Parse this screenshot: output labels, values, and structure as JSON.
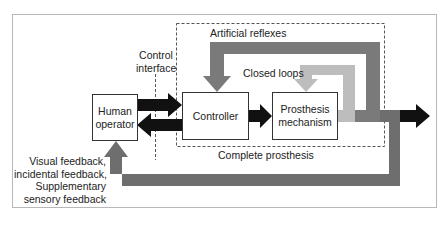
{
  "diagram": {
    "blocks": {
      "human_operator": "Human operator",
      "controller": "Controller",
      "prosthesis_mechanism": "Prosthesis mechanism"
    },
    "labels": {
      "control_interface": "Control interface",
      "artificial_reflexes": "Artificial reflexes",
      "closed_loops": "Closed loops",
      "complete_prosthesis": "Complete prosthesis",
      "feedback": "Visual feedback, incidental feedback, Supplementary sensory feedback"
    },
    "feedback_lines": [
      "Visual feedback,",
      "incidental feedback,",
      "Supplementary",
      "sensory feedback"
    ],
    "control_interface_lines": [
      "Control",
      "interface"
    ],
    "human_operator_lines": [
      "Human",
      "operator"
    ],
    "prosthesis_lines": [
      "Prosthesis",
      "mechanism"
    ],
    "colors": {
      "black_arrow": "#111111",
      "artificial_reflex_band": "#7a7a7a",
      "closed_loop_band": "#bdbdbd",
      "feedback_band": "#6e6e6e",
      "dashed_border": "#555555"
    }
  }
}
